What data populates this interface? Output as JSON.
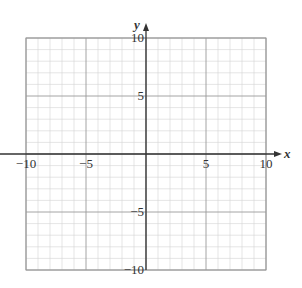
{
  "chart_data": {
    "type": "scatter",
    "title": "",
    "xlabel": "x",
    "ylabel": "y",
    "xlim": [
      -10,
      10
    ],
    "ylim": [
      -10,
      10
    ],
    "grid": true,
    "minor_grid_step": 1,
    "major_grid_step": 5,
    "x_ticks": [
      -10,
      -5,
      5,
      10
    ],
    "y_ticks": [
      -10,
      -5,
      5,
      10
    ],
    "x_tick_labels": [
      "−10",
      "−5",
      "5",
      "10"
    ],
    "y_tick_labels": [
      "−10",
      "−5",
      "5",
      "10"
    ],
    "series": [],
    "legend": null
  },
  "colors": {
    "minor_grid": "#d4d4d4",
    "major_grid": "#9a9a9a",
    "axis": "#333333",
    "border": "#9a9a9a"
  }
}
